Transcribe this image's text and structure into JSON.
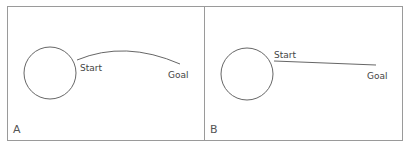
{
  "colors": {
    "border": "#9a9a9a",
    "stroke": "#555555",
    "text": "#444444",
    "background": "#ffffff"
  },
  "panels": [
    {
      "id": "A",
      "label": "A",
      "start_label": "Start",
      "goal_label": "Goal",
      "path_type": "curved"
    },
    {
      "id": "B",
      "label": "B",
      "start_label": "Start",
      "goal_label": "Goal",
      "path_type": "straight"
    }
  ]
}
